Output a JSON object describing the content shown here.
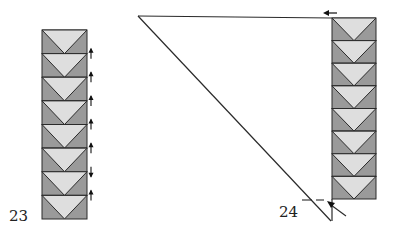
{
  "figure": {
    "type": "quilt-assembly-diagram",
    "colors": {
      "background": "#ffffff",
      "block_dark": "#9a9a9a",
      "block_light": "#dedede",
      "outline": "#2a2a2a",
      "trim_triangle_fill": "#ffffff"
    }
  },
  "steps": [
    {
      "label": "23",
      "description": "Vertical strip of 8 flying-geese units with seam pressing arrows",
      "units": 8,
      "pressing_arrows": [
        "up",
        "up",
        "up",
        "up",
        "up",
        "down",
        "up"
      ]
    },
    {
      "label": "24",
      "description": "Large setting triangle attached to the left of a strip of 8 flying-geese units; trim arrows at top and bottom",
      "units": 8,
      "indicators": [
        "top-left-arrow",
        "bottom-trim-arrow",
        "dashed-trim-line"
      ]
    }
  ]
}
